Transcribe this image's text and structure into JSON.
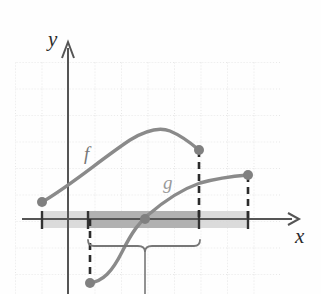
{
  "figure": {
    "axes": {
      "x_label": "x",
      "y_label": "y",
      "x_axis_y": 219,
      "y_axis_x": 68,
      "x_axis_start": 22,
      "x_axis_end": 297,
      "y_axis_top": 40,
      "y_axis_bottom": 294
    },
    "grid": {
      "visible": true,
      "style": "dotted",
      "color": "#cfcfcf",
      "left": 15,
      "top": 62,
      "right": 280,
      "bottom": 294,
      "spacing_x": 26.5,
      "spacing_y": 26.5
    },
    "curves": [
      {
        "name": "f",
        "label": "f",
        "label_x": 84,
        "label_y": 160,
        "color": "#8a8a8a",
        "path": "M 42,202 C 70,186 100,160 130,140 C 148,129 160,127 170,131 C 182,136 192,144 199,150",
        "endpoints": [
          {
            "x": 42,
            "y": 202,
            "dot": true
          },
          {
            "x": 199,
            "y": 150,
            "dot": true
          }
        ]
      },
      {
        "name": "g",
        "label": "g",
        "label_x": 163,
        "label_y": 189,
        "color": "#8a8a8a",
        "path": "M 90,283 C 103,281 112,272 122,252 C 133,230 140,222 148,215 C 163,202 180,190 200,183 C 218,178 236,176 248,175",
        "endpoints": [
          {
            "x": 90,
            "y": 283,
            "dot": true
          },
          {
            "x": 248,
            "y": 175,
            "dot": true
          }
        ]
      }
    ],
    "bands": [
      {
        "name": "light-band",
        "x": 42,
        "y": 211,
        "width": 206,
        "height": 17,
        "color": "#d5d5d5"
      },
      {
        "name": "dark-band",
        "x": 88,
        "y": 211,
        "width": 111,
        "height": 17,
        "color": "#a9a9a9"
      }
    ],
    "ticks": [
      {
        "x": 42,
        "y1": 212,
        "y2": 228
      },
      {
        "x": 88,
        "y1": 212,
        "y2": 228
      },
      {
        "x": 199,
        "y1": 212,
        "y2": 228
      },
      {
        "x": 248,
        "y1": 212,
        "y2": 228
      }
    ],
    "dashed_lines": [
      {
        "name": "f-right-drop",
        "x": 199,
        "y1": 150,
        "y2": 219
      },
      {
        "name": "g-right-drop",
        "x": 248,
        "y1": 175,
        "y2": 219
      },
      {
        "name": "g-left-rise",
        "x": 90,
        "y1": 219,
        "y2": 283
      }
    ],
    "brace": {
      "left": 88,
      "right": 200,
      "center": 145,
      "top": 240,
      "color": "#777777",
      "pointer_x": 145,
      "pointer_y1": 248,
      "pointer_y2": 294
    },
    "intersection": {
      "x": 145,
      "y": 219,
      "dot": true
    }
  }
}
